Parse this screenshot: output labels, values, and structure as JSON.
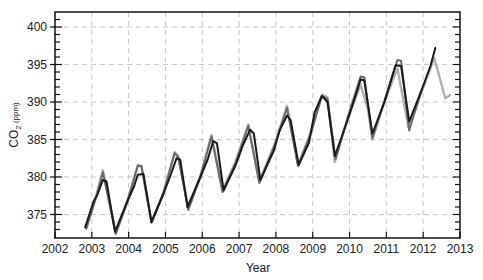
{
  "chart_data": {
    "type": "line",
    "title": "",
    "xlabel": "Year",
    "ylabel": "CO2 (ppm)",
    "ylabel_main": "CO",
    "ylabel_sub": "2",
    "ylabel_unit": " (ppm)",
    "xlim": [
      2002,
      2013
    ],
    "ylim": [
      372.1,
      402
    ],
    "xticks": [
      2002,
      2003,
      2004,
      2005,
      2006,
      2007,
      2008,
      2009,
      2010,
      2011,
      2012,
      2013
    ],
    "yticks": [
      375,
      380,
      385,
      390,
      395,
      400
    ],
    "grid": true,
    "grid_style": "dashed",
    "legend": null,
    "series": [
      {
        "name": "light-gray-series",
        "color": "#b0b0b0",
        "width": 2.4,
        "points": [
          [
            2002.85,
            373.2
          ],
          [
            2003.1,
            377.2
          ],
          [
            2003.3,
            380.9
          ],
          [
            2003.65,
            372.6
          ],
          [
            2003.95,
            376.6
          ],
          [
            2004.25,
            381.6
          ],
          [
            2004.35,
            381.5
          ],
          [
            2004.62,
            374.0
          ],
          [
            2004.95,
            378.0
          ],
          [
            2005.25,
            383.3
          ],
          [
            2005.35,
            382.8
          ],
          [
            2005.62,
            375.8
          ],
          [
            2005.95,
            380.2
          ],
          [
            2006.25,
            385.6
          ],
          [
            2006.55,
            378.2
          ],
          [
            2006.9,
            382.0
          ],
          [
            2007.25,
            387.0
          ],
          [
            2007.55,
            379.4
          ],
          [
            2007.95,
            384.2
          ],
          [
            2008.3,
            389.5
          ],
          [
            2008.6,
            381.6
          ],
          [
            2008.95,
            386.0
          ],
          [
            2009.25,
            391.0
          ],
          [
            2009.4,
            390.6
          ],
          [
            2009.6,
            382.0
          ],
          [
            2009.95,
            387.8
          ],
          [
            2010.3,
            392.3
          ],
          [
            2010.5,
            389.0
          ],
          [
            2010.62,
            385.0
          ],
          [
            2010.95,
            390.0
          ],
          [
            2011.3,
            394.5
          ],
          [
            2011.6,
            386.6
          ],
          [
            2011.95,
            391.2
          ],
          [
            2012.3,
            395.9
          ],
          [
            2012.6,
            390.5
          ],
          [
            2012.73,
            390.9
          ]
        ]
      },
      {
        "name": "dark-gray-series",
        "color": "#6a6a6a",
        "width": 2.0,
        "points": [
          [
            2002.85,
            373.1
          ],
          [
            2003.1,
            377.0
          ],
          [
            2003.3,
            380.6
          ],
          [
            2003.65,
            372.4
          ],
          [
            2003.95,
            376.4
          ],
          [
            2004.25,
            381.5
          ],
          [
            2004.35,
            381.4
          ],
          [
            2004.62,
            373.9
          ],
          [
            2004.95,
            377.9
          ],
          [
            2005.25,
            383.2
          ],
          [
            2005.35,
            382.6
          ],
          [
            2005.62,
            375.6
          ],
          [
            2005.95,
            380.0
          ],
          [
            2006.25,
            385.4
          ],
          [
            2006.55,
            378.0
          ],
          [
            2006.9,
            381.8
          ],
          [
            2007.25,
            386.8
          ],
          [
            2007.55,
            379.2
          ],
          [
            2007.95,
            384.0
          ],
          [
            2008.3,
            389.2
          ],
          [
            2008.6,
            381.5
          ],
          [
            2008.95,
            385.8
          ],
          [
            2009.25,
            390.8
          ],
          [
            2009.4,
            390.4
          ],
          [
            2009.62,
            382.4
          ],
          [
            2009.95,
            388.0
          ],
          [
            2010.3,
            393.4
          ],
          [
            2010.4,
            393.3
          ],
          [
            2010.62,
            385.2
          ],
          [
            2010.95,
            390.2
          ],
          [
            2011.3,
            395.6
          ],
          [
            2011.4,
            395.5
          ],
          [
            2011.62,
            386.2
          ],
          [
            2011.95,
            391.5
          ]
        ]
      },
      {
        "name": "black-series",
        "color": "#1a1a1a",
        "width": 2.0,
        "points": [
          [
            2002.82,
            373.3
          ],
          [
            2003.05,
            376.8
          ],
          [
            2003.15,
            377.6
          ],
          [
            2003.3,
            379.6
          ],
          [
            2003.4,
            379.4
          ],
          [
            2003.63,
            372.7
          ],
          [
            2003.95,
            376.6
          ],
          [
            2004.15,
            378.8
          ],
          [
            2004.25,
            380.3
          ],
          [
            2004.4,
            380.4
          ],
          [
            2004.62,
            374.0
          ],
          [
            2004.95,
            377.8
          ],
          [
            2005.15,
            380.4
          ],
          [
            2005.3,
            382.5
          ],
          [
            2005.4,
            382.3
          ],
          [
            2005.6,
            376.0
          ],
          [
            2005.95,
            380.0
          ],
          [
            2006.15,
            382.4
          ],
          [
            2006.3,
            384.8
          ],
          [
            2006.4,
            384.5
          ],
          [
            2006.58,
            378.2
          ],
          [
            2006.9,
            381.5
          ],
          [
            2007.1,
            384.2
          ],
          [
            2007.3,
            386.3
          ],
          [
            2007.4,
            385.8
          ],
          [
            2007.58,
            379.6
          ],
          [
            2007.95,
            383.6
          ],
          [
            2008.1,
            386.2
          ],
          [
            2008.3,
            388.2
          ],
          [
            2008.4,
            387.6
          ],
          [
            2008.62,
            381.6
          ],
          [
            2008.9,
            384.6
          ],
          [
            2009.05,
            388.6
          ],
          [
            2009.25,
            390.8
          ],
          [
            2009.4,
            390.0
          ],
          [
            2009.6,
            382.8
          ],
          [
            2009.95,
            387.6
          ],
          [
            2010.2,
            391.4
          ],
          [
            2010.3,
            393.0
          ],
          [
            2010.4,
            392.9
          ],
          [
            2010.62,
            385.8
          ],
          [
            2010.95,
            390.0
          ],
          [
            2011.25,
            394.9
          ],
          [
            2011.4,
            394.8
          ],
          [
            2011.62,
            387.4
          ],
          [
            2011.95,
            391.5
          ],
          [
            2012.2,
            394.8
          ],
          [
            2012.33,
            397.2
          ]
        ]
      }
    ]
  }
}
